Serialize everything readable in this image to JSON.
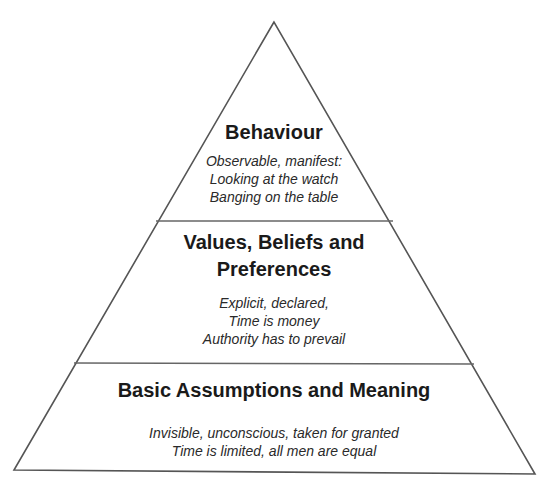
{
  "diagram": {
    "type": "pyramid",
    "layers": [
      {
        "title": "Behaviour",
        "description": [
          "Observable, manifest:",
          "Looking at the watch",
          "Banging on the table"
        ]
      },
      {
        "title": "Values, Beliefs and Preferences",
        "title_lines": [
          "Values, Beliefs and",
          "Preferences"
        ],
        "description": [
          "Explicit, declared,",
          "Time is money",
          "Authority has to prevail"
        ]
      },
      {
        "title": "Basic Assumptions and Meaning",
        "description": [
          "Invisible, unconscious, taken for granted",
          "Time is limited, all men are equal"
        ]
      }
    ],
    "line_color": "#555555"
  }
}
